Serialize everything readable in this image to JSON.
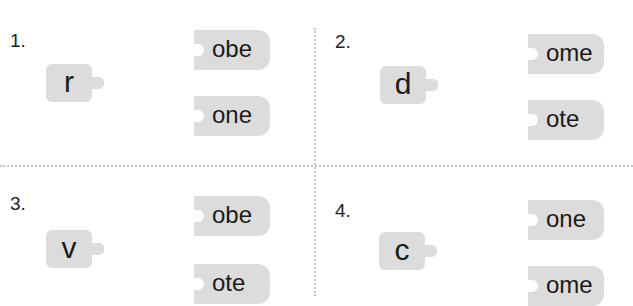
{
  "exercises": [
    {
      "number": "1.",
      "letter": "r",
      "options": [
        "obe",
        "one"
      ]
    },
    {
      "number": "2.",
      "letter": "d",
      "options": [
        "ome",
        "ote"
      ]
    },
    {
      "number": "3.",
      "letter": "v",
      "options": [
        "obe",
        "ote"
      ]
    },
    {
      "number": "4.",
      "letter": "c",
      "options": [
        "one",
        "ome"
      ]
    }
  ],
  "colors": {
    "piece": "#dcdcdc",
    "divider": "#c8c8c8",
    "text": "#1a1a1a"
  }
}
